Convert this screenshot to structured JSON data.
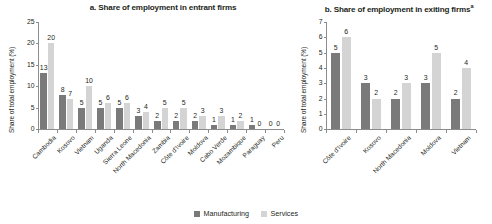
{
  "legend": {
    "items": [
      {
        "label": "Manufacturing",
        "color": "#7a7a7a",
        "key": "manufacturing"
      },
      {
        "label": "Services",
        "color": "#d4d4d4",
        "key": "services"
      }
    ]
  },
  "chart_data": [
    {
      "type": "bar",
      "panel": "a",
      "title": "a. Share of employment in entrant firms",
      "title_superscript": "",
      "xlabel": "",
      "ylabel": "Share of total employment (%)",
      "ylim": [
        0,
        25
      ],
      "yticks": [
        0,
        5,
        10,
        15,
        20,
        25
      ],
      "grid": false,
      "legend_position": "bottom-center",
      "categories": [
        "Cambodia",
        "Kosovo",
        "Vietnam",
        "Uganda",
        "Sierra Leone",
        "North Macedonia",
        "Zambia",
        "Côte d'Ivoire",
        "Moldova",
        "Cabo Verde",
        "Mozambique",
        "Paraguay",
        "Peru"
      ],
      "series": [
        {
          "name": "Manufacturing",
          "color": "#7a7a7a",
          "values": [
            13,
            8,
            5,
            5,
            5,
            3,
            2,
            2,
            2,
            1,
            1,
            1,
            0
          ]
        },
        {
          "name": "Services",
          "color": "#d4d4d4",
          "values": [
            20,
            7,
            10,
            6,
            6,
            4,
            5,
            5,
            3,
            3,
            2,
            0,
            0
          ]
        }
      ]
    },
    {
      "type": "bar",
      "panel": "b",
      "title": "b. Share of employment in exiting firms",
      "title_superscript": "a",
      "xlabel": "",
      "ylabel": "Share of total employment (%)",
      "ylim": [
        0,
        7
      ],
      "yticks": [
        0,
        1,
        2,
        3,
        4,
        5,
        6,
        7
      ],
      "grid": false,
      "legend_position": "bottom-center",
      "categories": [
        "Côte d'Ivoire",
        "Kosovo",
        "North Macedonia",
        "Moldova",
        "Vietnam"
      ],
      "series": [
        {
          "name": "Manufacturing",
          "color": "#7a7a7a",
          "values": [
            5,
            3,
            2,
            3,
            2
          ]
        },
        {
          "name": "Services",
          "color": "#d4d4d4",
          "values": [
            6,
            2,
            3,
            5,
            4
          ]
        }
      ]
    }
  ]
}
